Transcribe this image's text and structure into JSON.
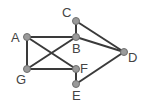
{
  "graph": {
    "nodes": [
      {
        "id": "A",
        "label": "A",
        "x": 27,
        "y": 37,
        "lx": 11,
        "ly": 42
      },
      {
        "id": "B",
        "label": "B",
        "x": 76,
        "y": 37,
        "lx": 72,
        "ly": 53
      },
      {
        "id": "C",
        "label": "C",
        "x": 76,
        "y": 21,
        "lx": 62,
        "ly": 17
      },
      {
        "id": "D",
        "label": "D",
        "x": 124,
        "y": 52,
        "lx": 128,
        "ly": 62
      },
      {
        "id": "E",
        "label": "E",
        "x": 76,
        "y": 84,
        "lx": 72,
        "ly": 100
      },
      {
        "id": "F",
        "label": "F",
        "x": 76,
        "y": 69,
        "lx": 80,
        "ly": 73
      },
      {
        "id": "G",
        "label": "G",
        "x": 27,
        "y": 69,
        "lx": 16,
        "ly": 84
      }
    ],
    "edges": [
      [
        "A",
        "B"
      ],
      [
        "A",
        "G"
      ],
      [
        "A",
        "F"
      ],
      [
        "G",
        "B"
      ],
      [
        "G",
        "F"
      ],
      [
        "B",
        "C"
      ],
      [
        "B",
        "D"
      ],
      [
        "C",
        "D"
      ],
      [
        "F",
        "E"
      ],
      [
        "E",
        "D"
      ]
    ]
  }
}
